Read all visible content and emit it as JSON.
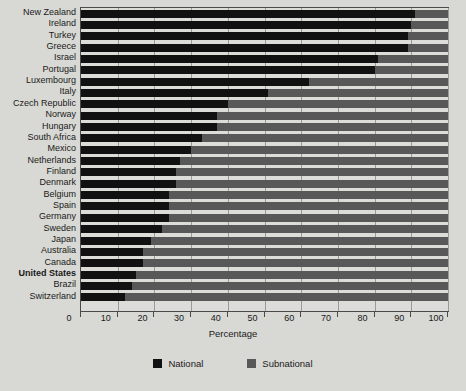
{
  "chart_data": {
    "type": "bar",
    "orientation": "horizontal",
    "stacked": true,
    "title": "",
    "xlabel": "Percentage",
    "ylabel": "",
    "xlim": [
      0,
      100
    ],
    "xticks": [
      0,
      10,
      20,
      30,
      40,
      50,
      60,
      70,
      80,
      90,
      100
    ],
    "grid": true,
    "legend_position": "bottom",
    "categories": [
      "New Zealand",
      "Ireland",
      "Turkey",
      "Greece",
      "Israel",
      "Portugal",
      "Luxembourg",
      "Italy",
      "Czech Republic",
      "Norway",
      "Hungary",
      "South Africa",
      "Mexico",
      "Netherlands",
      "Finland",
      "Denmark",
      "Belgium",
      "Spain",
      "Germany",
      "Sweden",
      "Japan",
      "Australia",
      "Canada",
      "United States",
      "Brazil",
      "Switzerland"
    ],
    "highlight_category": "United States",
    "series": [
      {
        "name": "National",
        "color": "#111111",
        "values": [
          91,
          90,
          89,
          89,
          81,
          80,
          62,
          51,
          40,
          37,
          37,
          33,
          30,
          27,
          26,
          26,
          24,
          24,
          24,
          22,
          19,
          17,
          17,
          15,
          14,
          12
        ]
      },
      {
        "name": "Subnational",
        "color": "#585858",
        "values": [
          9,
          10,
          11,
          11,
          19,
          20,
          38,
          49,
          60,
          63,
          63,
          67,
          70,
          73,
          74,
          74,
          76,
          76,
          76,
          78,
          81,
          83,
          83,
          85,
          86,
          88
        ]
      }
    ]
  },
  "legend": {
    "items": [
      {
        "label": "National",
        "color": "#111111"
      },
      {
        "label": "Subnational",
        "color": "#585858"
      }
    ]
  }
}
